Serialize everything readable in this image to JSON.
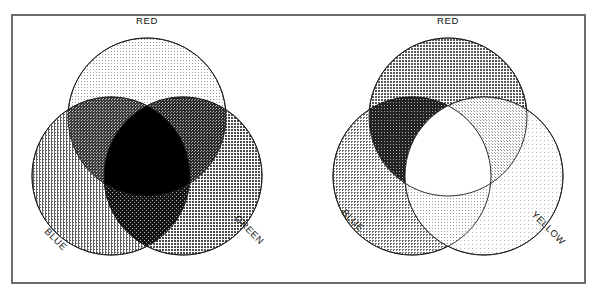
{
  "figure": {
    "title": "",
    "frame": {
      "x": 11,
      "y": 14,
      "width": 575,
      "height": 270,
      "stroke": "#6d6d6d",
      "stroke_width": 2,
      "fill": "#ffffff"
    },
    "background": "#ffffff"
  },
  "diagrams": [
    {
      "id": "additive-rgb",
      "name": "additive-color-venn",
      "center_fill": "#000000",
      "circles": [
        {
          "name": "red",
          "label": "RED",
          "cx": 147,
          "cy": 117,
          "r": 79,
          "fill": "#dedede",
          "label_x": 147,
          "label_y": 24,
          "label_rotate": 0,
          "label_anchor": "middle"
        },
        {
          "name": "blue",
          "label": "BLUE",
          "cx": 111,
          "cy": 176,
          "r": 79,
          "fill": "#a9a9a9",
          "label_x": 44,
          "label_y": 232,
          "label_rotate": 45,
          "label_anchor": "start"
        },
        {
          "name": "green",
          "label": "GREEN",
          "cx": 183,
          "cy": 176,
          "r": 79,
          "fill": "#8f8f8f",
          "label_x": 234,
          "label_y": 219,
          "label_rotate": 45,
          "label_anchor": "start"
        }
      ],
      "pairs": [
        {
          "name": "red-green",
          "a": "red",
          "b": "green",
          "fill": "#4a4a4a"
        },
        {
          "name": "red-blue",
          "a": "red",
          "b": "blue",
          "fill": "#5c5c5c"
        },
        {
          "name": "blue-green",
          "a": "blue",
          "b": "green",
          "fill": "#2e2e2e"
        }
      ],
      "triple": {
        "name": "red-green-blue",
        "fill": "#000000"
      }
    },
    {
      "id": "subtractive-ryb",
      "name": "subtractive-color-venn",
      "center_fill": "#ffffff",
      "circles": [
        {
          "name": "red",
          "label": "RED",
          "cx": 448,
          "cy": 117,
          "r": 79,
          "fill": "#939393",
          "label_x": 448,
          "label_y": 24,
          "label_rotate": 0,
          "label_anchor": "middle"
        },
        {
          "name": "blue",
          "label": "BLUE",
          "cx": 412,
          "cy": 176,
          "r": 79,
          "fill": "#b4b4b4",
          "label_x": 341,
          "label_y": 213,
          "label_rotate": 45,
          "label_anchor": "start"
        },
        {
          "name": "yellow",
          "label": "YELLOW",
          "cx": 484,
          "cy": 176,
          "r": 79,
          "fill": "#f0f0f0",
          "label_x": 531,
          "label_y": 215,
          "label_rotate": 45,
          "label_anchor": "start"
        }
      ],
      "pairs": [
        {
          "name": "red-yellow",
          "a": "red",
          "b": "yellow",
          "fill": "#cecece"
        },
        {
          "name": "red-blue",
          "a": "red",
          "b": "blue",
          "fill": "#3f3f3f"
        },
        {
          "name": "blue-yellow",
          "a": "blue",
          "b": "yellow",
          "fill": "#dcdcdc"
        }
      ],
      "triple": {
        "name": "red-blue-yellow",
        "fill": "#ffffff"
      }
    }
  ]
}
